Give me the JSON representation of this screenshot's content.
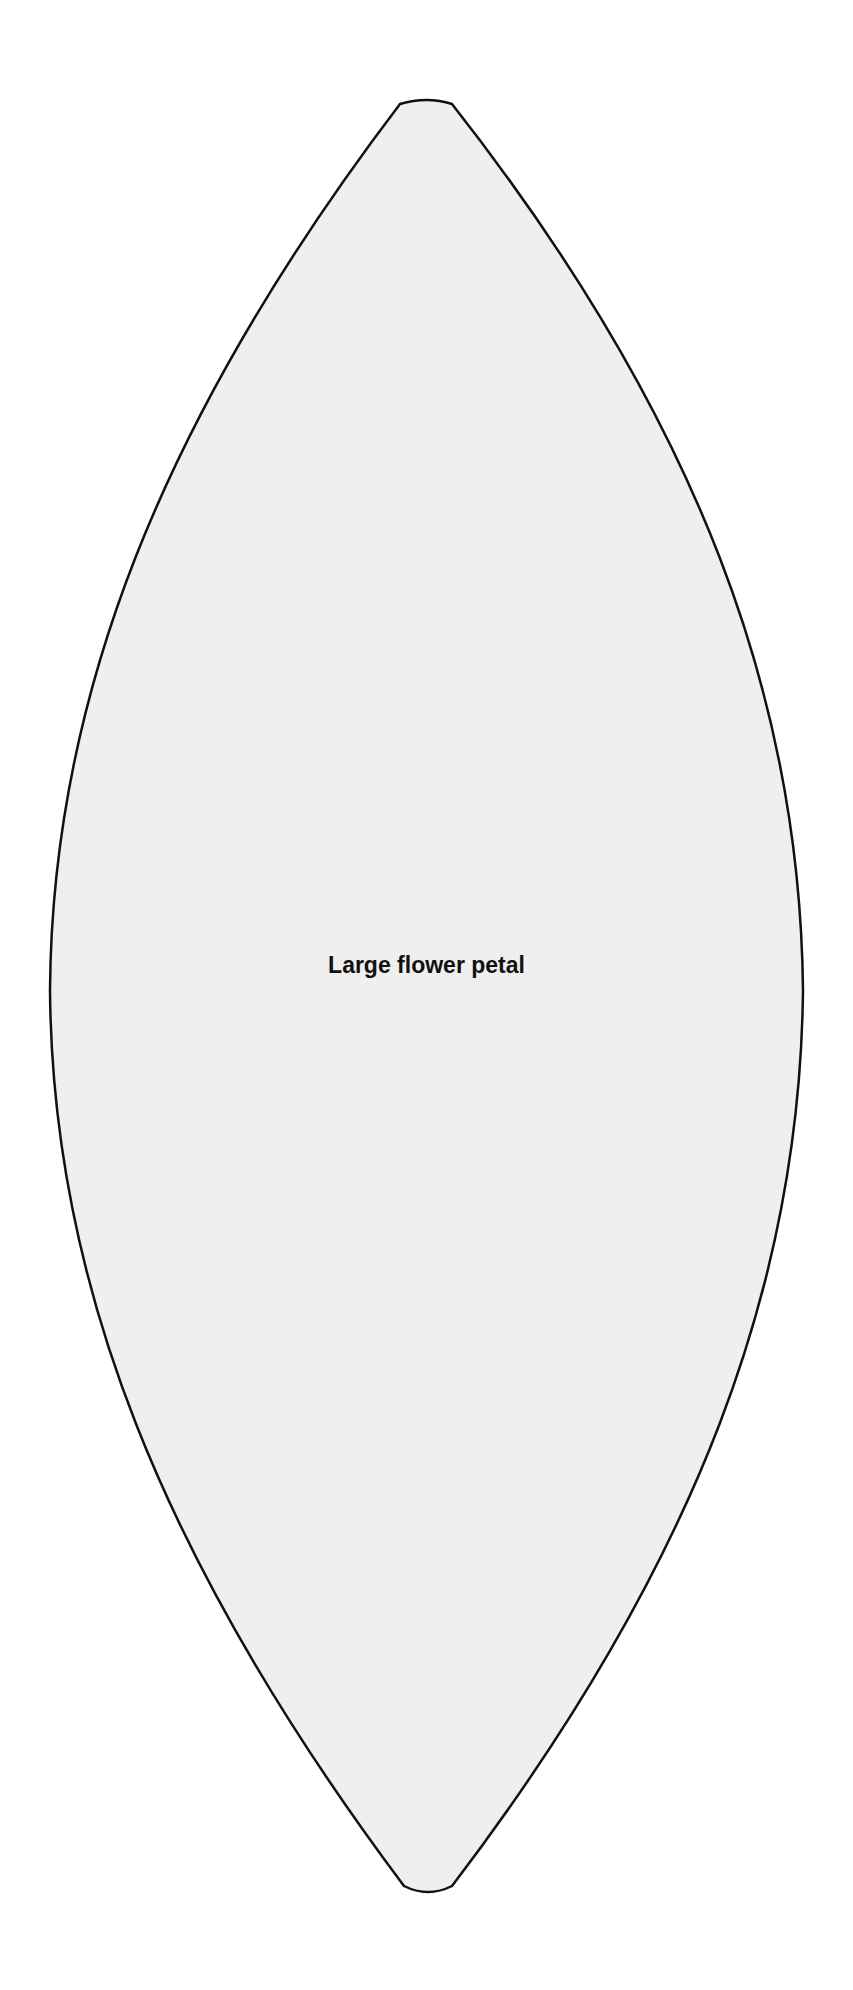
{
  "diagram": {
    "shape": "lens/petal",
    "label": "Large flower petal",
    "fill_color": "#efefef",
    "stroke_color": "#111111"
  }
}
